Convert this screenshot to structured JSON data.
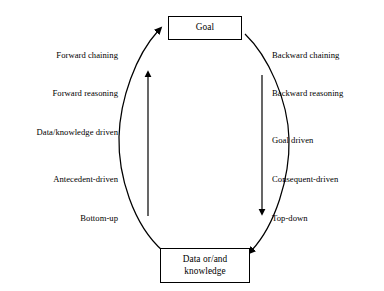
{
  "diagram": {
    "colors": {
      "stroke": "#000000",
      "background": "#ffffff",
      "text": "#000000"
    },
    "nodes": [
      {
        "id": "goal",
        "label": "Goal",
        "position": "top"
      },
      {
        "id": "data",
        "label": "Data or/and\nknowledge",
        "position": "bottom"
      }
    ],
    "left_labels": [
      {
        "id": "forward-chaining",
        "text": "Forward chaining",
        "y": 54
      },
      {
        "id": "forward-reasoning",
        "text": "Forward reasoning",
        "y": 92
      },
      {
        "id": "data-knowledge-driven",
        "text": "Data/knowledge driven",
        "y": 131
      },
      {
        "id": "antecedent-driven",
        "text": "Antecedent-driven",
        "y": 178
      },
      {
        "id": "bottom-up",
        "text": "Bottom-up",
        "y": 217
      }
    ],
    "right_labels": [
      {
        "id": "backward-chaining",
        "text": "Backward chaining",
        "y": 54
      },
      {
        "id": "backward-reasoning",
        "text": "Backward reasoning",
        "y": 92
      },
      {
        "id": "goal-driven",
        "text": "Goal driven",
        "y": 139
      },
      {
        "id": "consequent-driven",
        "text": "Consequent-driven",
        "y": 178
      },
      {
        "id": "top-down",
        "text": "Top-down",
        "y": 217
      }
    ],
    "edges": [
      {
        "id": "left-curve",
        "from": "data",
        "to": "goal",
        "direction": "upward",
        "style": "curved",
        "arrowhead": "at-goal"
      },
      {
        "id": "right-curve",
        "from": "goal",
        "to": "data",
        "direction": "downward",
        "style": "curved",
        "arrowhead": "at-data"
      },
      {
        "id": "left-straight-arrow",
        "direction": "upward",
        "style": "straight",
        "arrowhead": "top"
      },
      {
        "id": "right-straight-arrow",
        "direction": "downward",
        "style": "straight",
        "arrowhead": "bottom"
      }
    ]
  }
}
